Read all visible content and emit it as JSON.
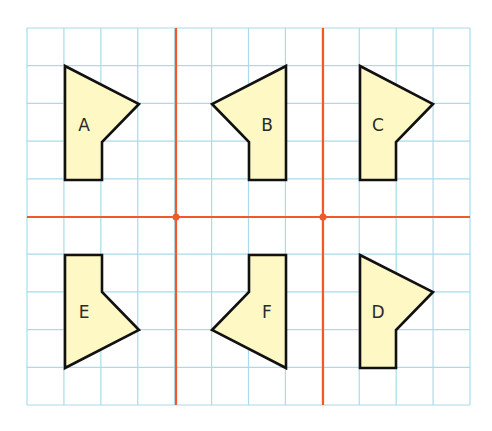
{
  "diagram": {
    "type": "grid-reflection-exercise",
    "grid": {
      "left": 27,
      "top": 28,
      "right": 470,
      "bottom": 405,
      "cell": 36.9,
      "cols": 12,
      "rows": 10,
      "line_color": "#a8dcea"
    },
    "mirror_lines": {
      "color": "#f05a28",
      "vertical_x": [
        176,
        323
      ],
      "horizontal_y": [
        217
      ],
      "intersection_points": [
        [
          176,
          217
        ],
        [
          323,
          217
        ]
      ]
    },
    "shape_style": {
      "fill": "#fdf8c4",
      "stroke": "#111111"
    },
    "shapes": [
      {
        "label": "A",
        "points": "65,66 139,104 102,142 102,180 65,180",
        "label_x": 84,
        "label_y": 131
      },
      {
        "label": "B",
        "points": "286,66 212,104 249,142 249,180 286,180",
        "label_x": 267,
        "label_y": 131
      },
      {
        "label": "C",
        "points": "360,66 433,104 396,142 396,180 360,180",
        "label_x": 378,
        "label_y": 131
      },
      {
        "label": "E",
        "points": "65,255 102,255 102,292 139,330 65,368",
        "label_x": 84,
        "label_y": 318
      },
      {
        "label": "F",
        "points": "249,255 286,255 286,368 212,330 249,292",
        "label_x": 267,
        "label_y": 318
      },
      {
        "label": "D",
        "points": "360,255 433,292 396,330 396,368 360,368",
        "label_x": 378,
        "label_y": 318
      }
    ]
  }
}
